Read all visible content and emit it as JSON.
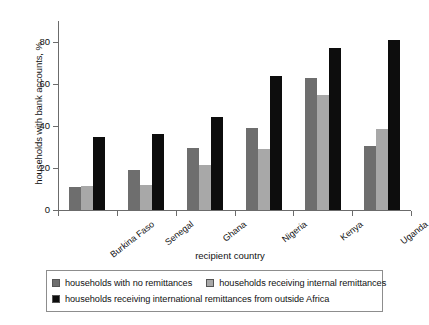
{
  "chart_data": {
    "type": "bar",
    "title": "",
    "xlabel": "recipient country",
    "ylabel": "households with bank accounts, %",
    "ylim": [
      0,
      90
    ],
    "yticks": [
      0,
      20,
      40,
      60,
      80
    ],
    "grid": false,
    "legend_position": "bottom",
    "categories": [
      "Burkina Faso",
      "Senegal",
      "Ghana",
      "Nigeria",
      "Kenya",
      "Uganda"
    ],
    "series": [
      {
        "name": "households with no remittances",
        "color": "#6e6e6e",
        "values": [
          11,
          19,
          29.5,
          39,
          63,
          30.5
        ]
      },
      {
        "name": "households receiving internal remittances",
        "color": "#a8a8a8",
        "values": [
          11.5,
          12,
          21.5,
          29,
          55,
          38.5
        ]
      },
      {
        "name": "households receiving international remittances from outside Africa",
        "color": "#0d0d0d",
        "values": [
          35,
          36,
          44.5,
          64,
          77,
          81
        ]
      }
    ]
  },
  "axes": {
    "y_title": "households with bank accounts, %",
    "x_title": "recipient country",
    "y_tick_labels": [
      "0",
      "20",
      "40",
      "60",
      "80"
    ],
    "x_tick_labels": [
      "Burkina Faso",
      "Senegal",
      "Ghana",
      "Nigeria",
      "Kenya",
      "Uganda"
    ]
  },
  "legend": {
    "entries": [
      {
        "label": "households with no remittances",
        "color": "#6e6e6e"
      },
      {
        "label": "households receiving internal remittances",
        "color": "#a8a8a8"
      },
      {
        "label": "households receiving international remittances from outside Africa",
        "color": "#0d0d0d"
      }
    ]
  }
}
